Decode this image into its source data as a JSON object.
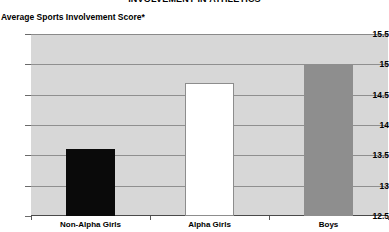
{
  "chart_data": {
    "type": "bar",
    "title": "INVOLVEMENT IN ATHLETICS",
    "ylabel": "Average Sports Involvement Score*",
    "xlabel": "",
    "categories": [
      "Non-Alpha Girls",
      "Alpha Girls",
      "Boys"
    ],
    "values": [
      13.6,
      14.7,
      15.0
    ],
    "series": [
      {
        "name": "Average Sports Involvement Score",
        "values": [
          13.6,
          14.7,
          15.0
        ]
      }
    ],
    "bar_colors": [
      "#0a0a0a",
      "#ffffff",
      "#8e8e8e"
    ],
    "ylim": [
      12.5,
      15.5
    ],
    "yticks": [
      "12.5",
      "13",
      "13.5",
      "14",
      "14.5",
      "15",
      "15.5"
    ],
    "ytick_values": [
      12.5,
      13,
      13.5,
      14,
      14.5,
      15,
      15.5
    ],
    "grid": true,
    "legend": false,
    "legend_position": "none",
    "plot_background": "#d7d7d7",
    "gridline_color": "#8f8f8f"
  },
  "axis": {
    "y_label_text": "Average Sports Involvement Score*",
    "ticks": [
      {
        "label": "15.5",
        "value": 15.5
      },
      {
        "label": "15",
        "value": 15
      },
      {
        "label": "14.5",
        "value": 14.5
      },
      {
        "label": "14",
        "value": 14
      },
      {
        "label": "13.5",
        "value": 13.5
      },
      {
        "label": "13",
        "value": 13
      },
      {
        "label": "12.5",
        "value": 12.5
      }
    ]
  },
  "bars": [
    {
      "label": "Non-Alpha Girls",
      "value": 13.6,
      "style": "black"
    },
    {
      "label": "Alpha Girls",
      "value": 14.7,
      "style": "white"
    },
    {
      "label": "Boys",
      "value": 15.0,
      "style": "gray"
    }
  ],
  "header": {
    "title": "INVOLVEMENT IN ATHLETICS"
  }
}
